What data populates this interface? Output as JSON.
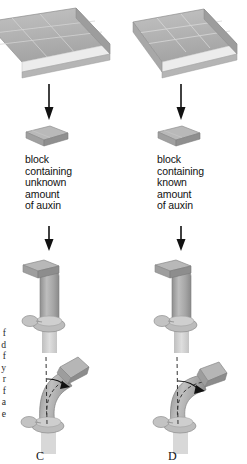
{
  "figure": {
    "background_color": "#ffffff",
    "ink_color": "#111111",
    "agar_gray_top": "#b4b4b4",
    "agar_gray_side": "#9a9a9a",
    "agar_gray_front": "#e2e2e2",
    "coleoptile_gray": "#a9a9a9",
    "arrow_color": "#111111",
    "dash_color": "#333333"
  },
  "edge_caption": {
    "clipped_fragments": "f\nd\nf\ny\nr\nf\na\ne"
  },
  "panels": [
    {
      "letter": "C",
      "side": "left",
      "slab": {
        "name": "agar-slab",
        "clipped": true,
        "grid_cols": 3,
        "grid_rows": 3
      },
      "arrow_1": "down-arrow",
      "block": {
        "name": "agar-block",
        "caption": "block\ncontaining\nunknown\namount\nof auxin"
      },
      "arrow_2": "down-arrow",
      "tip": {
        "name": "coleoptile-stump-with-block",
        "state": "upright",
        "block_offset": "left"
      },
      "bend": {
        "name": "curved-coleoptile",
        "state": "curved",
        "curvature_direction": "right",
        "curvature_angle_deg": 38,
        "has_dashed_vertical": true,
        "has_angle_arrow": true
      }
    },
    {
      "letter": "D",
      "side": "right",
      "slab": {
        "name": "agar-slab",
        "clipped": false,
        "grid_cols": 3,
        "grid_rows": 3
      },
      "arrow_1": "down-arrow",
      "block": {
        "name": "agar-block",
        "caption": "block\ncontaining\nknown\namount\nof auxin"
      },
      "arrow_2": "down-arrow",
      "tip": {
        "name": "coleoptile-stump-with-block",
        "state": "upright",
        "block_offset": "left"
      },
      "bend": {
        "name": "curved-coleoptile",
        "state": "curved",
        "curvature_direction": "right",
        "curvature_angle_deg": 52,
        "has_dashed_vertical": true,
        "has_angle_arrow": true
      }
    }
  ]
}
